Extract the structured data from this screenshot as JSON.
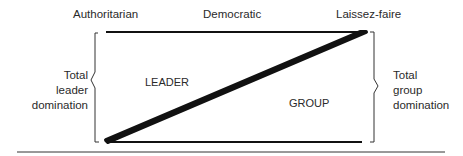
{
  "diagram": {
    "type": "leadership-continuum",
    "top_labels": {
      "left": "Authoritarian",
      "center": "Democratic",
      "right": "Laissez-faire"
    },
    "region_labels": {
      "upper_left": "LEADER",
      "lower_right": "GROUP"
    },
    "side_labels": {
      "left": [
        "Total",
        "leader",
        "domination"
      ],
      "right": [
        "Total",
        "group",
        "domination"
      ]
    },
    "colors": {
      "line": "#111111",
      "text": "#2a2a2a",
      "background": "#ffffff"
    }
  }
}
